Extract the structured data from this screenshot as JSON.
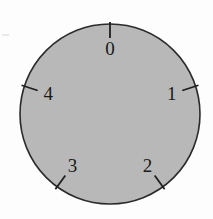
{
  "figure": {
    "alt_description": "Circular gray dial with five tick marks labeled 0 through 4",
    "background_color": "#fdfdfd"
  },
  "dial": {
    "face_color": "#b8b8b8",
    "outline_color": "#2b2b2b",
    "tick_color": "#1f1f1f",
    "label_color": "#1a1a1a",
    "center_x": 110,
    "center_y": 114,
    "radius": 90
  },
  "chart_data": {
    "type": "pie",
    "title": "",
    "subtitle": "",
    "xlabel": "",
    "ylabel": "",
    "grid": false,
    "legend_position": "none",
    "divisions": 5,
    "step_degrees": 72,
    "start_angle_degrees": 0,
    "direction": "clockwise",
    "categories": [
      "0",
      "1",
      "2",
      "3",
      "4"
    ],
    "values": [
      72,
      72,
      72,
      72,
      72
    ],
    "ticks": [
      {
        "label": "0",
        "angle_degrees": 0,
        "label_radius": 66,
        "tick_inner_radius": 76,
        "tick_outer_radius": 92
      },
      {
        "label": "1",
        "angle_degrees": 72,
        "label_radius": 65,
        "tick_inner_radius": 76,
        "tick_outer_radius": 93
      },
      {
        "label": "2",
        "angle_degrees": 144,
        "label_radius": 64,
        "tick_inner_radius": 76,
        "tick_outer_radius": 93
      },
      {
        "label": "3",
        "angle_degrees": 216,
        "label_radius": 64,
        "tick_inner_radius": 76,
        "tick_outer_radius": 93
      },
      {
        "label": "4",
        "angle_degrees": 288,
        "label_radius": 65,
        "tick_inner_radius": 76,
        "tick_outer_radius": 93
      }
    ]
  }
}
